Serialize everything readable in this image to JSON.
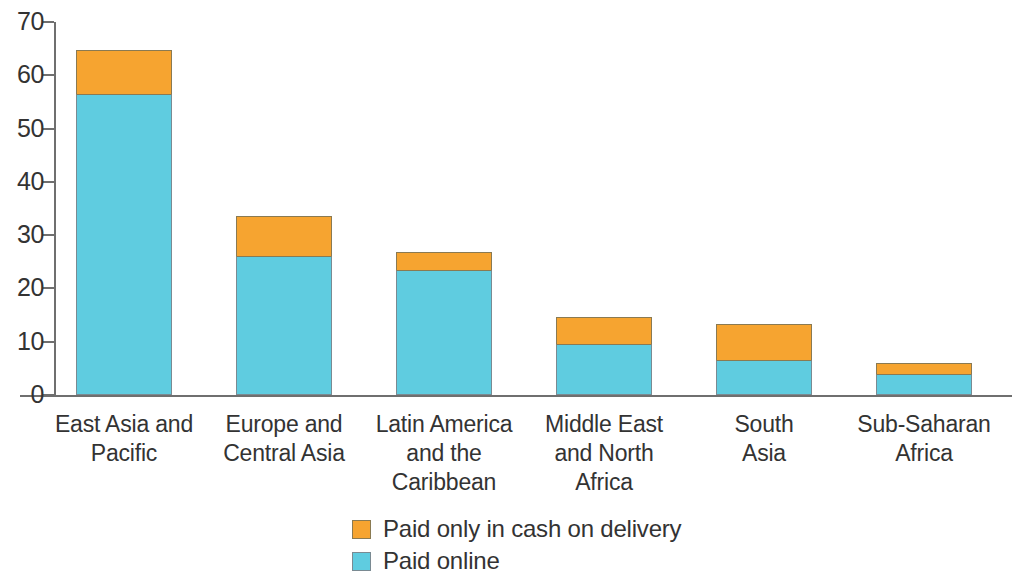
{
  "chart_data": {
    "type": "bar",
    "subtype": "stacked-bar",
    "title": "",
    "subtitle": "",
    "xlabel": "",
    "ylabel": "",
    "ylim": [
      0,
      70
    ],
    "ytick_values": [
      0,
      10,
      20,
      30,
      40,
      50,
      60,
      70
    ],
    "ytick_labels": [
      "0",
      "10",
      "20",
      "30",
      "40",
      "50",
      "60",
      "70"
    ],
    "grid": false,
    "legend_position": "bottom-center",
    "categories": [
      "East Asia and Pacific",
      "Europe and Central Asia",
      "Latin America and the Caribbean",
      "Middle East and North Africa",
      "South Asia",
      "Sub-Saharan Africa"
    ],
    "category_lines": [
      [
        "East Asia and",
        "Pacific"
      ],
      [
        "Europe and",
        "Central Asia"
      ],
      [
        "Latin America",
        "and the",
        "Caribbean"
      ],
      [
        "Middle East",
        "and North",
        "Africa"
      ],
      [
        "South",
        "Asia"
      ],
      [
        "Sub-Saharan",
        "Africa"
      ]
    ],
    "series": [
      {
        "name": "Paid online",
        "color": "#5FCCE0",
        "values": [
          56.5,
          26.0,
          23.4,
          9.5,
          6.6,
          4.0
        ]
      },
      {
        "name": "Paid only in cash on delivery",
        "color": "#F6A430",
        "values": [
          8.2,
          7.5,
          3.4,
          5.1,
          6.7,
          2.0
        ]
      }
    ],
    "totals": [
      64.7,
      33.5,
      26.8,
      14.6,
      13.3,
      6.0
    ]
  },
  "legend": {
    "items": [
      {
        "label": "Paid only in cash on delivery",
        "color": "#F6A430",
        "swatch": "legend-swatch-cash"
      },
      {
        "label": "Paid online",
        "color": "#5FCCE0",
        "swatch": "legend-swatch-online"
      }
    ]
  },
  "axis": {
    "y": {
      "ticks": [
        "70",
        "60",
        "50",
        "40",
        "30",
        "20",
        "10",
        "0"
      ]
    }
  },
  "colors": {
    "cash": "#F6A430",
    "online": "#5FCCE0",
    "axis": "#6f6f6f",
    "text": "#333333",
    "background": "#ffffff"
  }
}
